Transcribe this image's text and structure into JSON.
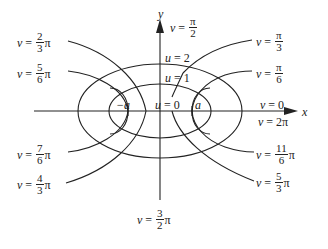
{
  "figure": {
    "axes": {
      "x_label": "x",
      "y_label": "y"
    },
    "foci": {
      "left_label": "−a",
      "right_label": "a"
    },
    "u_curves": [
      {
        "id": "u0",
        "label": "u = 0",
        "var": "u",
        "value": "0"
      },
      {
        "id": "u1",
        "label": "u = 1",
        "var": "u",
        "value": "1"
      },
      {
        "id": "u2",
        "label": "u = 2",
        "var": "u",
        "value": "2"
      }
    ],
    "v_curves": [
      {
        "id": "v0",
        "var": "v",
        "num": "",
        "den": "",
        "text": "0"
      },
      {
        "id": "v2pi",
        "var": "v",
        "num": "",
        "den": "",
        "text": "2π"
      },
      {
        "id": "v_pi6",
        "var": "v",
        "num": "π",
        "den": "6",
        "suffix": ""
      },
      {
        "id": "v_pi3",
        "var": "v",
        "num": "π",
        "den": "3",
        "suffix": ""
      },
      {
        "id": "v_pi2",
        "var": "v",
        "num": "π",
        "den": "2",
        "suffix": ""
      },
      {
        "id": "v_2pi3",
        "var": "v",
        "num": "2",
        "den": "3",
        "suffix": "π"
      },
      {
        "id": "v_5pi6",
        "var": "v",
        "num": "5",
        "den": "6",
        "suffix": "π"
      },
      {
        "id": "v_7pi6",
        "var": "v",
        "num": "7",
        "den": "6",
        "suffix": "π"
      },
      {
        "id": "v_4pi3",
        "var": "v",
        "num": "4",
        "den": "3",
        "suffix": "π"
      },
      {
        "id": "v_3pi2",
        "var": "v",
        "num": "3",
        "den": "2",
        "suffix": "π"
      },
      {
        "id": "v_5pi3",
        "var": "v",
        "num": "5",
        "den": "3",
        "suffix": "π"
      },
      {
        "id": "v_11pi6",
        "var": "v",
        "num": "11",
        "den": "6",
        "suffix": "π"
      }
    ],
    "equals": "=",
    "stroke_color": "#222222",
    "background": "#ffffff"
  }
}
